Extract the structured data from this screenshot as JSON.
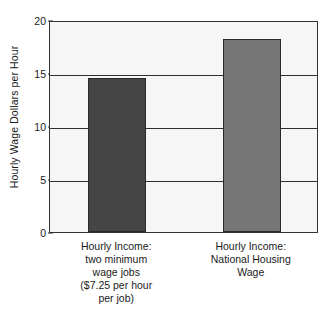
{
  "chart_data": {
    "type": "bar",
    "title": "",
    "xlabel": "",
    "ylabel": "Hourly Wage Dollars per Hour",
    "ylim": [
      0,
      20
    ],
    "yticks": [
      0,
      5,
      10,
      15,
      20
    ],
    "ytick_labels": [
      "0",
      "5",
      "10",
      "15",
      "20"
    ],
    "grid": true,
    "legend": "none",
    "categories": [
      "Hourly Income: two minimum wage jobs ($7.25 per hour per job)",
      "Hourly Income: National Housing Wage"
    ],
    "category_lines": [
      [
        "Hourly Income:",
        "two minimum",
        "wage jobs",
        "($7.25 per hour",
        "per job)"
      ],
      [
        "Hourly Income:",
        "National Housing",
        "Wage"
      ]
    ],
    "values": [
      14.5,
      18.25
    ],
    "bar_colors": [
      "#454545",
      "#767676"
    ],
    "plot_background": "#f6f6f6",
    "axis_color": "#333333"
  },
  "axis": {
    "y_title": "Hourly Wage Dollars per Hour"
  }
}
